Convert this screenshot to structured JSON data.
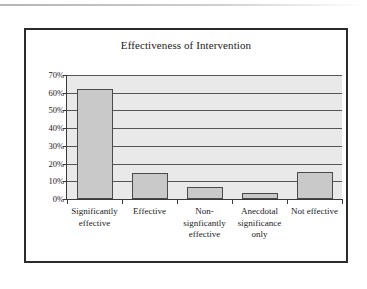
{
  "chart_data": {
    "type": "bar",
    "title": "Effectiveness of Intervention",
    "xlabel": "",
    "ylabel": "",
    "ylim": [
      0,
      70
    ],
    "grid": true,
    "legend": false,
    "categories": [
      "Significantly effective",
      "Effective",
      "Non-signficantly effective",
      "Anecdotal significance only",
      "Not effective"
    ],
    "category_lines": [
      [
        "Significantly",
        "effective"
      ],
      [
        "Effective"
      ],
      [
        "Non-",
        "signficantly",
        "effective"
      ],
      [
        "Anecdotal",
        "significance",
        "only"
      ],
      [
        "Not effective"
      ]
    ],
    "values": [
      62,
      14.5,
      7,
      3.5,
      15
    ],
    "ytick_labels": [
      "70%",
      "60%",
      "50%",
      "40%",
      "30%",
      "20%",
      "10%",
      "0%"
    ],
    "ytick_values": [
      70,
      60,
      50,
      40,
      30,
      20,
      10,
      0
    ]
  },
  "colors": {
    "frame": "#2b2b2b",
    "plot_background": "#e9e9e9",
    "bar_fill": "#c9c9c9",
    "bar_border": "#4a4a4a",
    "gridline": "#555555",
    "axis": "#3a3a3a",
    "text": "#1a1a1a",
    "page_background": "#ffffff"
  }
}
